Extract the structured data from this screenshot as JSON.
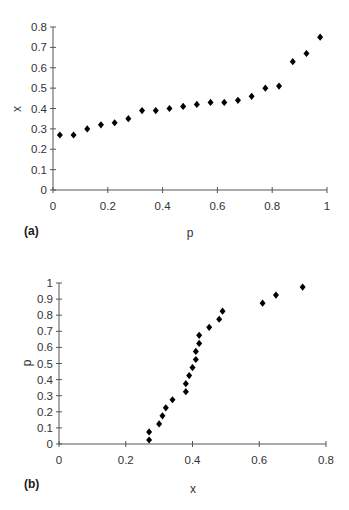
{
  "chart_data": [
    {
      "type": "scatter",
      "panel_label": "(a)",
      "title": "",
      "xlabel": "p",
      "ylabel": "x",
      "xlim": [
        0,
        1
      ],
      "ylim": [
        0,
        0.8
      ],
      "xticks": [
        "0",
        "0.2",
        "0.4",
        "0.6",
        "0.8",
        "1"
      ],
      "yticks": [
        "0",
        "0.1",
        "0.2",
        "0.3",
        "0.4",
        "0.5",
        "0.6",
        "0.7",
        "0.8"
      ],
      "grid": false,
      "legend": null,
      "marker": "diamond",
      "marker_color": "#000000",
      "x": [
        0.025,
        0.075,
        0.125,
        0.175,
        0.225,
        0.275,
        0.325,
        0.375,
        0.425,
        0.475,
        0.525,
        0.575,
        0.625,
        0.675,
        0.725,
        0.775,
        0.825,
        0.875,
        0.925,
        0.975
      ],
      "y": [
        0.27,
        0.27,
        0.3,
        0.32,
        0.33,
        0.35,
        0.39,
        0.39,
        0.4,
        0.41,
        0.42,
        0.43,
        0.43,
        0.44,
        0.46,
        0.5,
        0.51,
        0.63,
        0.67,
        0.75
      ]
    },
    {
      "type": "scatter",
      "panel_label": "(b)",
      "title": "",
      "xlabel": "x",
      "ylabel": "p",
      "xlim": [
        0,
        0.8
      ],
      "ylim": [
        0,
        1
      ],
      "xticks": [
        "0",
        "0.2",
        "0.4",
        "0.6",
        "0.8"
      ],
      "yticks": [
        "0",
        "0.1",
        "0.2",
        "0.3",
        "0.4",
        "0.5",
        "0.6",
        "0.7",
        "0.8",
        "0.9",
        "1"
      ],
      "grid": false,
      "legend": null,
      "marker": "diamond",
      "marker_color": "#000000",
      "x": [
        0.27,
        0.27,
        0.3,
        0.31,
        0.32,
        0.34,
        0.38,
        0.38,
        0.39,
        0.4,
        0.41,
        0.41,
        0.42,
        0.42,
        0.45,
        0.48,
        0.49,
        0.61,
        0.65,
        0.73
      ],
      "y": [
        0.025,
        0.075,
        0.125,
        0.175,
        0.225,
        0.275,
        0.325,
        0.375,
        0.425,
        0.475,
        0.525,
        0.575,
        0.625,
        0.675,
        0.725,
        0.775,
        0.825,
        0.875,
        0.925,
        0.975
      ]
    }
  ]
}
